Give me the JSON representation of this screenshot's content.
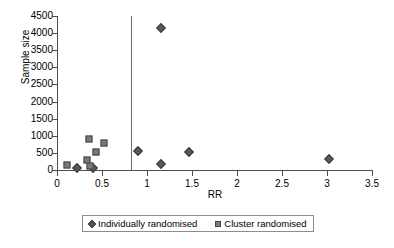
{
  "chart_data": {
    "type": "scatter",
    "title": "",
    "xlabel": "RR",
    "ylabel": "Sample size",
    "xlim": [
      0,
      3.5
    ],
    "ylim": [
      0,
      4500
    ],
    "xticks": [
      "0",
      "0.5",
      "1",
      "1.5",
      "2",
      "2.5",
      "3",
      "3.5"
    ],
    "xtick_values": [
      0,
      0.5,
      1,
      1.5,
      2,
      2.5,
      3,
      3.5
    ],
    "yticks": [
      "0",
      "500",
      "1000",
      "1500",
      "2000",
      "2500",
      "3000",
      "3500",
      "4000",
      "4500"
    ],
    "ytick_values": [
      0,
      500,
      1000,
      1500,
      2000,
      2500,
      3000,
      3500,
      4000,
      4500
    ],
    "grid": false,
    "legend_position": "bottom-center",
    "reference_line": {
      "orientation": "vertical",
      "x": 0.82,
      "color": "#6b6b6b"
    },
    "series": [
      {
        "name": "Individually randomised",
        "marker": "diamond",
        "color": "#585858",
        "points": [
          {
            "x": 0.22,
            "y": 60
          },
          {
            "x": 0.4,
            "y": 70
          },
          {
            "x": 0.9,
            "y": 560
          },
          {
            "x": 1.15,
            "y": 4150
          },
          {
            "x": 1.15,
            "y": 170
          },
          {
            "x": 1.47,
            "y": 530
          },
          {
            "x": 3.02,
            "y": 320
          }
        ]
      },
      {
        "name": "Cluster randomised",
        "marker": "square",
        "color": "#7a7a7a",
        "points": [
          {
            "x": 0.11,
            "y": 150
          },
          {
            "x": 0.33,
            "y": 290
          },
          {
            "x": 0.35,
            "y": 900
          },
          {
            "x": 0.37,
            "y": 120
          },
          {
            "x": 0.43,
            "y": 540
          },
          {
            "x": 0.52,
            "y": 780
          }
        ]
      }
    ]
  },
  "legend": {
    "items": [
      {
        "label": "Individually randomised",
        "marker": "diamond"
      },
      {
        "label": "Cluster randomised",
        "marker": "square"
      }
    ]
  }
}
